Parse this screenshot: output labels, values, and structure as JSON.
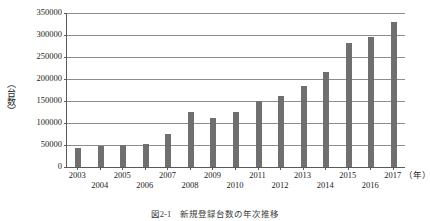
{
  "chart_data": {
    "type": "bar",
    "title": "",
    "xlabel": "（年）",
    "ylabel": "（台数）",
    "categories": [
      "2003",
      "2004",
      "2005",
      "2006",
      "2007",
      "2008",
      "2009",
      "2010",
      "2011",
      "2012",
      "2013",
      "2014",
      "2015",
      "2016",
      "2017"
    ],
    "values": [
      43000,
      48000,
      50000,
      53000,
      75000,
      126000,
      112000,
      126000,
      150000,
      162000,
      185000,
      215000,
      281000,
      295000,
      330000
    ],
    "ylim": [
      0,
      350000
    ],
    "yticks": [
      0,
      50000,
      100000,
      150000,
      200000,
      250000,
      300000,
      350000
    ],
    "ytick_labels": [
      "0",
      "50000",
      "100000",
      "150000",
      "200000",
      "250000",
      "300000",
      "350000"
    ],
    "grid": true,
    "legend": "none",
    "bar_color": "#6f6f6f",
    "axis_color": "#5a5a5a",
    "grid_color": "#8d8d8d"
  },
  "axis": {
    "y_unit_label": "（台数）",
    "x_unit_label": "（年）"
  },
  "caption": {
    "text": "図2-1　新規登録台数の年次推移"
  }
}
